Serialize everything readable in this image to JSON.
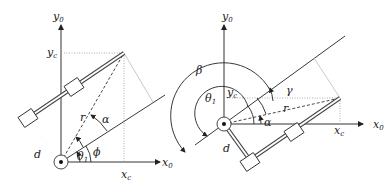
{
  "figure": {
    "panels": [
      {
        "id": "left",
        "labels": {
          "y_axis": "y",
          "y_axis_sub": "0",
          "x_axis": "x",
          "x_axis_sub": "0",
          "yc": "y",
          "yc_sub": "c",
          "xc": "x",
          "xc_sub": "c",
          "r": "r",
          "alpha": "α",
          "theta": "θ",
          "theta_sub": "1",
          "phi": "ϕ",
          "d": "d"
        }
      },
      {
        "id": "right",
        "labels": {
          "y_axis": "y",
          "y_axis_sub": "0",
          "x_axis": "x",
          "x_axis_sub": "0",
          "yc": "y",
          "yc_sub": "c",
          "xc": "x",
          "xc_sub": "c",
          "r": "r",
          "alpha": "α",
          "gamma": "γ",
          "beta": "β",
          "theta": "θ",
          "theta_sub": "1",
          "d": "d"
        }
      }
    ]
  }
}
